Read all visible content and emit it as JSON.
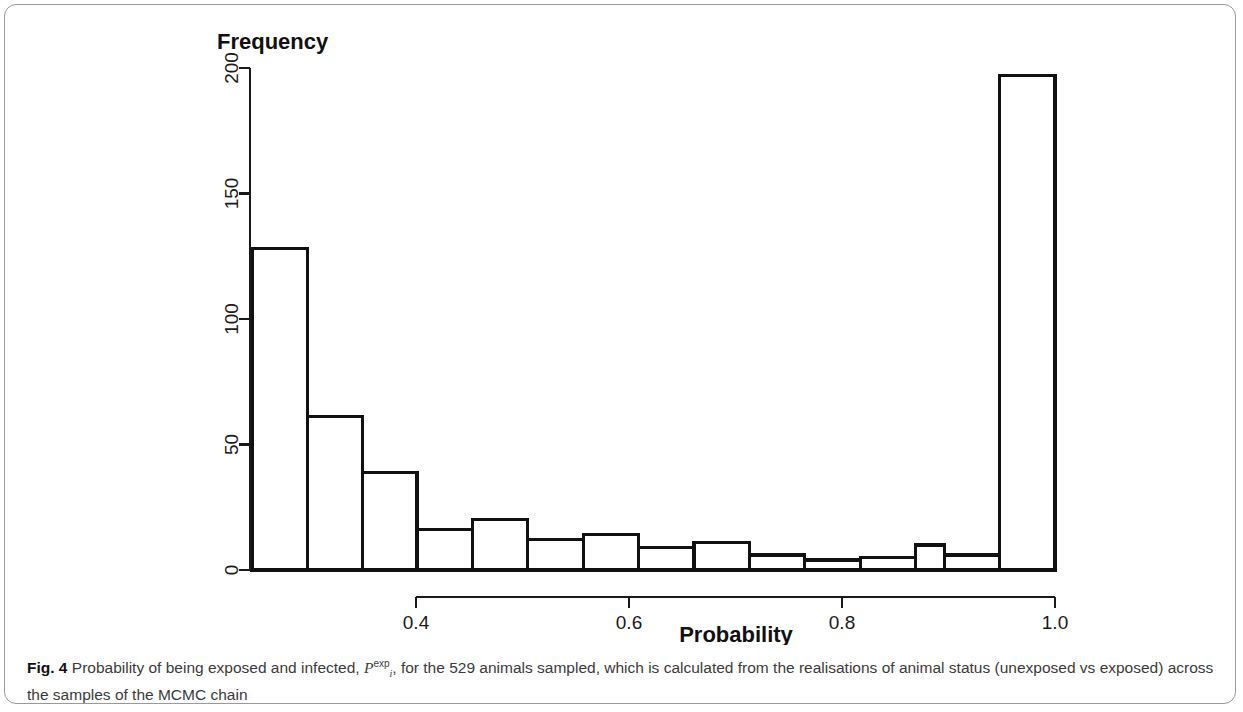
{
  "figure": {
    "label": "Fig. 4",
    "caption_part1": "Probability of being exposed and infected,",
    "math_base": "P",
    "math_sub": "i",
    "math_sup": "exp",
    "caption_part2": ", for the 529 animals sampled, which is calculated from the realisations of animal status",
    "caption_line2": "(unexposed vs exposed) across the samples of the MCMC chain"
  },
  "chart_data": {
    "type": "bar",
    "title": "",
    "ylabel": "Frequency",
    "xlabel": "Probability",
    "xlim": [
      0.2457,
      0.8077
    ],
    "ylim": [
      0,
      200
    ],
    "xticks": [
      0.4,
      0.6,
      0.8,
      1.0
    ],
    "xticklabels": [
      "0.4",
      "0.6",
      "0.8",
      "1.0"
    ],
    "yticks": [
      0,
      50,
      100,
      150,
      200
    ],
    "yticklabels": [
      "0",
      "50",
      "100",
      "150",
      "200"
    ],
    "grid": false,
    "legend": null,
    "bin_width": 0.0521,
    "bin_edges": [
      0.246,
      0.298,
      0.35,
      0.401,
      0.453,
      0.505,
      0.557,
      0.609,
      0.661,
      0.713,
      0.765,
      0.817,
      0.869,
      0.896,
      0.948,
      1.0
    ],
    "categories": [
      "0.25-0.30",
      "0.30-0.35",
      "0.35-0.40",
      "0.40-0.45",
      "0.45-0.50",
      "0.50-0.55",
      "0.55-0.60",
      "0.60-0.65",
      "0.65-0.70",
      "0.70-0.75",
      "0.75-0.80",
      "0.80-0.85",
      "0.85-0.90",
      "0.90-0.95",
      "0.95-1.00"
    ],
    "values": [
      128,
      61,
      39,
      16,
      20,
      12,
      14,
      9,
      11,
      6,
      4,
      5,
      10,
      6,
      197
    ],
    "bar_fill": "#ffffff",
    "bar_stroke": "#111111",
    "axis_color": "#1a1a1a"
  }
}
